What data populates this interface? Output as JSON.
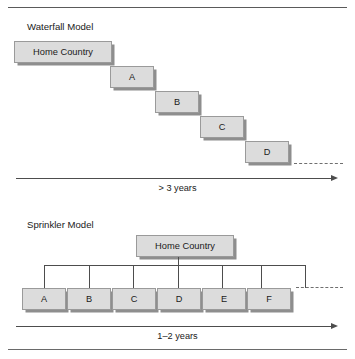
{
  "page": {
    "running_head": "WATERFALL VERSUS SPRINKLER MODELS"
  },
  "waterfall": {
    "title": "Waterfall Model",
    "root_label": "Home Country",
    "steps": [
      {
        "label": "A"
      },
      {
        "label": "B"
      },
      {
        "label": "C"
      },
      {
        "label": "D"
      }
    ],
    "timeline_label": "> 3 years"
  },
  "sprinkler": {
    "title": "Sprinkler Model",
    "root_label": "Home Country",
    "markets": [
      {
        "label": "A"
      },
      {
        "label": "B"
      },
      {
        "label": "C"
      },
      {
        "label": "D"
      },
      {
        "label": "E"
      },
      {
        "label": "F"
      }
    ],
    "timeline_label": "1–2 years"
  },
  "colors": {
    "node_fill": "#dcdcdc",
    "node_border": "#9a9a9a",
    "node_shadow": "#8e8e8e",
    "line": "#4d4d4d",
    "dash": "#6f6f6f",
    "text": "#1a1a1a"
  }
}
